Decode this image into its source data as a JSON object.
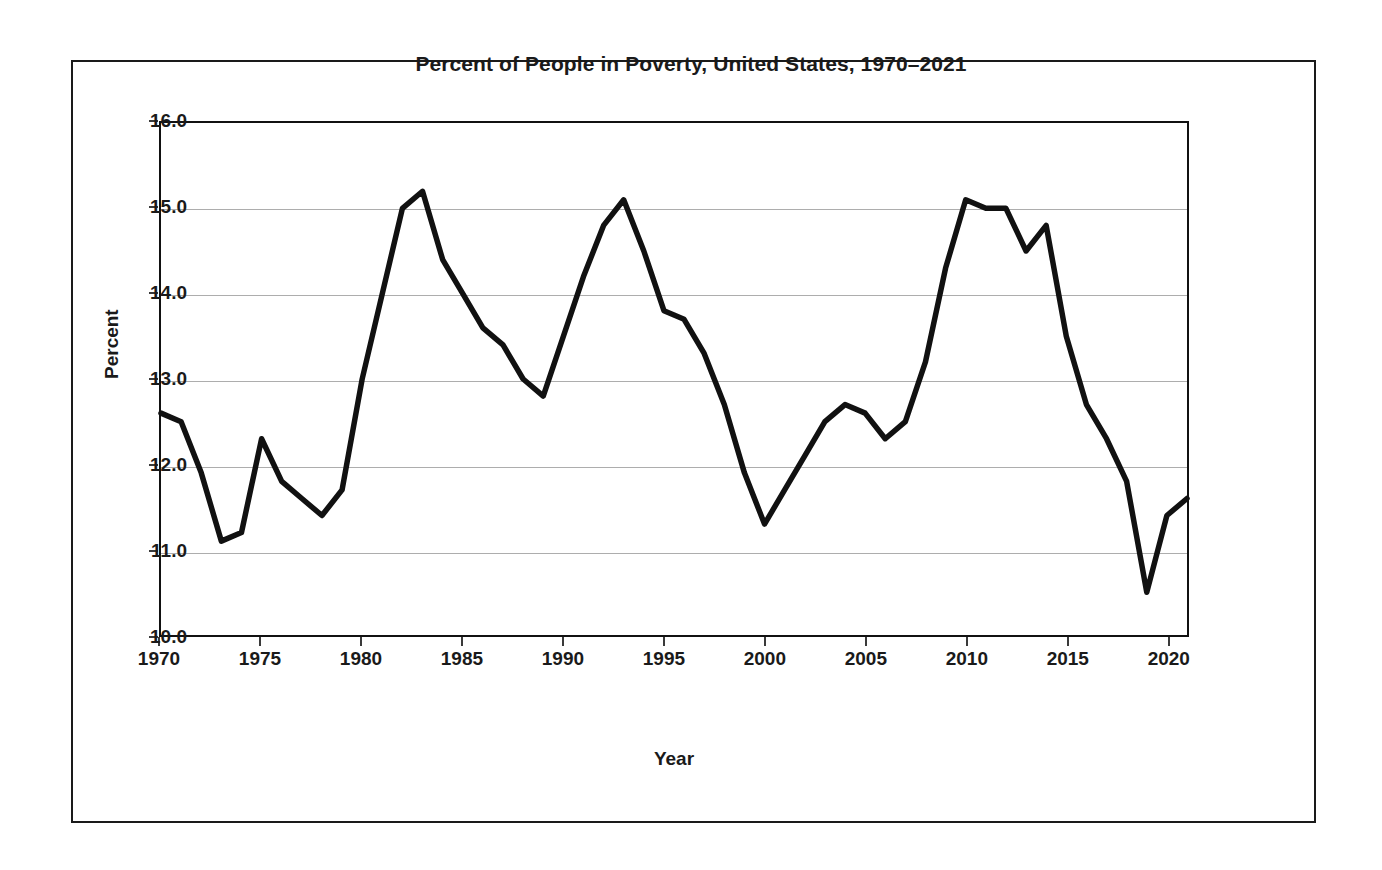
{
  "chart_data": {
    "type": "line",
    "title": "Percent of People in Poverty, United States, 1970–2021",
    "xlabel": "Year",
    "ylabel": "Percent",
    "xlim": [
      1970,
      2021
    ],
    "ylim": [
      10.0,
      16.0
    ],
    "grid": true,
    "legend": null,
    "legend_position": "none",
    "line_color": "#111111",
    "x_tick_labels": [
      "1970",
      "1975",
      "1980",
      "1985",
      "1990",
      "1995",
      "2000",
      "2005",
      "2010",
      "2015",
      "2020"
    ],
    "x_ticks": [
      1970,
      1975,
      1980,
      1985,
      1990,
      1995,
      2000,
      2005,
      2010,
      2015,
      2020
    ],
    "y_tick_labels": [
      "10.0",
      "11.0",
      "12.0",
      "13.0",
      "14.0",
      "15.0",
      "16.0"
    ],
    "y_ticks": [
      10.0,
      11.0,
      12.0,
      13.0,
      14.0,
      15.0,
      16.0
    ],
    "x": [
      1970,
      1971,
      1972,
      1973,
      1974,
      1975,
      1976,
      1977,
      1978,
      1979,
      1980,
      1981,
      1982,
      1983,
      1984,
      1985,
      1986,
      1987,
      1988,
      1989,
      1990,
      1991,
      1992,
      1993,
      1994,
      1995,
      1996,
      1997,
      1998,
      1999,
      2000,
      2001,
      2002,
      2003,
      2004,
      2005,
      2006,
      2007,
      2008,
      2009,
      2010,
      2011,
      2012,
      2013,
      2014,
      2015,
      2016,
      2017,
      2018,
      2019,
      2020,
      2021
    ],
    "values": [
      12.6,
      12.5,
      11.9,
      11.1,
      11.2,
      12.3,
      11.8,
      11.6,
      11.4,
      11.7,
      13.0,
      14.0,
      15.0,
      15.2,
      14.4,
      14.0,
      13.6,
      13.4,
      13.0,
      12.8,
      13.5,
      14.2,
      14.8,
      15.1,
      14.5,
      13.8,
      13.7,
      13.3,
      12.7,
      11.9,
      11.3,
      11.7,
      12.1,
      12.5,
      12.7,
      12.6,
      12.3,
      12.5,
      13.2,
      14.3,
      15.1,
      15.0,
      15.0,
      14.5,
      14.8,
      13.5,
      12.7,
      12.3,
      11.8,
      10.5,
      11.4,
      11.6
    ],
    "series": [
      {
        "name": "Percent of people in poverty",
        "values": [
          12.6,
          12.5,
          11.9,
          11.1,
          11.2,
          12.3,
          11.8,
          11.6,
          11.4,
          11.7,
          13.0,
          14.0,
          15.0,
          15.2,
          14.4,
          14.0,
          13.6,
          13.4,
          13.0,
          12.8,
          13.5,
          14.2,
          14.8,
          15.1,
          14.5,
          13.8,
          13.7,
          13.3,
          12.7,
          11.9,
          11.3,
          11.7,
          12.1,
          12.5,
          12.7,
          12.6,
          12.3,
          12.5,
          13.2,
          14.3,
          15.1,
          15.0,
          15.0,
          14.5,
          14.8,
          13.5,
          12.7,
          12.3,
          11.8,
          10.5,
          11.4,
          11.6
        ]
      }
    ]
  }
}
